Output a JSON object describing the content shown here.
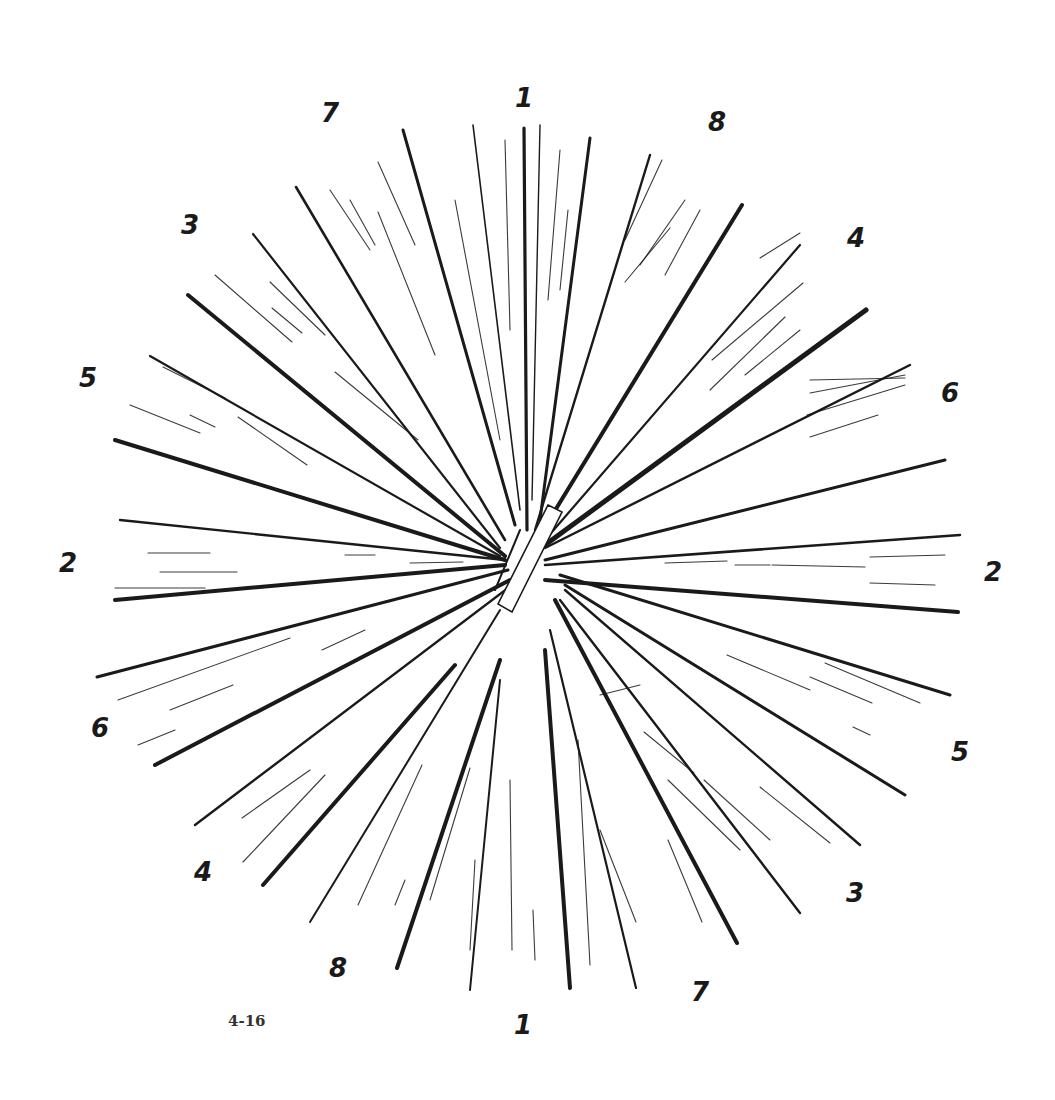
{
  "figure": {
    "caption": "4-16",
    "center": [
      527,
      565
    ],
    "ink_color": "#1a1a1a",
    "background": "#ffffff"
  },
  "labels": [
    {
      "text": "1",
      "x": 524,
      "y": 98
    },
    {
      "text": "7",
      "x": 330,
      "y": 113
    },
    {
      "text": "8",
      "x": 717,
      "y": 122
    },
    {
      "text": "3",
      "x": 190,
      "y": 225
    },
    {
      "text": "4",
      "x": 856,
      "y": 238
    },
    {
      "text": "5",
      "x": 88,
      "y": 378
    },
    {
      "text": "6",
      "x": 950,
      "y": 393
    },
    {
      "text": "2",
      "x": 68,
      "y": 563
    },
    {
      "text": "2",
      "x": 993,
      "y": 572
    },
    {
      "text": "6",
      "x": 100,
      "y": 728
    },
    {
      "text": "5",
      "x": 960,
      "y": 752
    },
    {
      "text": "4",
      "x": 203,
      "y": 872
    },
    {
      "text": "3",
      "x": 855,
      "y": 893
    },
    {
      "text": "8",
      "x": 338,
      "y": 968
    },
    {
      "text": "7",
      "x": 700,
      "y": 992
    },
    {
      "text": "1",
      "x": 523,
      "y": 1025
    }
  ],
  "rays": [
    {
      "x1": 473,
      "y1": 125,
      "x2": 520,
      "y2": 510,
      "w": 1.6
    },
    {
      "x1": 524,
      "y1": 128,
      "x2": 527,
      "y2": 530,
      "w": 3.2
    },
    {
      "x1": 540,
      "y1": 125,
      "x2": 532,
      "y2": 500,
      "w": 1.4
    },
    {
      "x1": 590,
      "y1": 138,
      "x2": 540,
      "y2": 520,
      "w": 3.0
    },
    {
      "x1": 403,
      "y1": 130,
      "x2": 515,
      "y2": 525,
      "w": 3.0
    },
    {
      "x1": 296,
      "y1": 187,
      "x2": 505,
      "y2": 540,
      "w": 2.6
    },
    {
      "x1": 253,
      "y1": 234,
      "x2": 500,
      "y2": 548,
      "w": 2.2
    },
    {
      "x1": 188,
      "y1": 295,
      "x2": 505,
      "y2": 556,
      "w": 4.0
    },
    {
      "x1": 150,
      "y1": 356,
      "x2": 500,
      "y2": 556,
      "w": 2.2
    },
    {
      "x1": 115,
      "y1": 440,
      "x2": 505,
      "y2": 560,
      "w": 4.0
    },
    {
      "x1": 120,
      "y1": 520,
      "x2": 505,
      "y2": 560,
      "w": 2.4
    },
    {
      "x1": 115,
      "y1": 600,
      "x2": 505,
      "y2": 565,
      "w": 4.0
    },
    {
      "x1": 97,
      "y1": 677,
      "x2": 508,
      "y2": 570,
      "w": 3.0
    },
    {
      "x1": 155,
      "y1": 765,
      "x2": 510,
      "y2": 580,
      "w": 4.0
    },
    {
      "x1": 195,
      "y1": 825,
      "x2": 512,
      "y2": 585,
      "w": 2.4
    },
    {
      "x1": 263,
      "y1": 885,
      "x2": 455,
      "y2": 665,
      "w": 4.0
    },
    {
      "x1": 310,
      "y1": 922,
      "x2": 500,
      "y2": 610,
      "w": 2.0
    },
    {
      "x1": 397,
      "y1": 968,
      "x2": 500,
      "y2": 660,
      "w": 4.0
    },
    {
      "x1": 470,
      "y1": 990,
      "x2": 500,
      "y2": 680,
      "w": 2.0
    },
    {
      "x1": 570,
      "y1": 988,
      "x2": 545,
      "y2": 650,
      "w": 4.0
    },
    {
      "x1": 636,
      "y1": 988,
      "x2": 550,
      "y2": 630,
      "w": 2.2
    },
    {
      "x1": 737,
      "y1": 943,
      "x2": 555,
      "y2": 600,
      "w": 4.0
    },
    {
      "x1": 800,
      "y1": 913,
      "x2": 560,
      "y2": 600,
      "w": 2.4
    },
    {
      "x1": 860,
      "y1": 845,
      "x2": 565,
      "y2": 590,
      "w": 2.4
    },
    {
      "x1": 905,
      "y1": 795,
      "x2": 565,
      "y2": 585,
      "w": 3.0
    },
    {
      "x1": 950,
      "y1": 695,
      "x2": 560,
      "y2": 575,
      "w": 3.0
    },
    {
      "x1": 958,
      "y1": 612,
      "x2": 545,
      "y2": 580,
      "w": 4.0
    },
    {
      "x1": 960,
      "y1": 535,
      "x2": 545,
      "y2": 565,
      "w": 2.6
    },
    {
      "x1": 945,
      "y1": 460,
      "x2": 545,
      "y2": 560,
      "w": 3.0
    },
    {
      "x1": 910,
      "y1": 365,
      "x2": 545,
      "y2": 548,
      "w": 2.4
    },
    {
      "x1": 866,
      "y1": 310,
      "x2": 545,
      "y2": 545,
      "w": 5.0
    },
    {
      "x1": 800,
      "y1": 245,
      "x2": 545,
      "y2": 540,
      "w": 2.2
    },
    {
      "x1": 742,
      "y1": 205,
      "x2": 540,
      "y2": 535,
      "w": 4.0
    },
    {
      "x1": 650,
      "y1": 155,
      "x2": 535,
      "y2": 530,
      "w": 2.4
    },
    {
      "x1": 545,
      "y1": 515,
      "x2": 505,
      "y2": 600,
      "w": 3.0
    },
    {
      "x1": 520,
      "y1": 530,
      "x2": 495,
      "y2": 590,
      "w": 2.0
    }
  ],
  "hatch_strokes": [
    {
      "x1": 455,
      "y1": 200,
      "x2": 500,
      "y2": 440
    },
    {
      "x1": 505,
      "y1": 140,
      "x2": 510,
      "y2": 330
    },
    {
      "x1": 560,
      "y1": 150,
      "x2": 548,
      "y2": 300
    },
    {
      "x1": 330,
      "y1": 190,
      "x2": 370,
      "y2": 250
    },
    {
      "x1": 350,
      "y1": 200,
      "x2": 375,
      "y2": 245
    },
    {
      "x1": 378,
      "y1": 162,
      "x2": 415,
      "y2": 245
    },
    {
      "x1": 378,
      "y1": 212,
      "x2": 435,
      "y2": 355
    },
    {
      "x1": 215,
      "y1": 275,
      "x2": 292,
      "y2": 342
    },
    {
      "x1": 270,
      "y1": 282,
      "x2": 325,
      "y2": 335
    },
    {
      "x1": 272,
      "y1": 308,
      "x2": 302,
      "y2": 333
    },
    {
      "x1": 335,
      "y1": 372,
      "x2": 418,
      "y2": 440
    },
    {
      "x1": 163,
      "y1": 367,
      "x2": 225,
      "y2": 398
    },
    {
      "x1": 130,
      "y1": 405,
      "x2": 200,
      "y2": 433
    },
    {
      "x1": 238,
      "y1": 417,
      "x2": 307,
      "y2": 465
    },
    {
      "x1": 190,
      "y1": 415,
      "x2": 215,
      "y2": 427
    },
    {
      "x1": 148,
      "y1": 553,
      "x2": 210,
      "y2": 553
    },
    {
      "x1": 160,
      "y1": 572,
      "x2": 237,
      "y2": 572
    },
    {
      "x1": 115,
      "y1": 588,
      "x2": 205,
      "y2": 588
    },
    {
      "x1": 345,
      "y1": 555,
      "x2": 375,
      "y2": 555
    },
    {
      "x1": 410,
      "y1": 563,
      "x2": 463,
      "y2": 562
    },
    {
      "x1": 118,
      "y1": 700,
      "x2": 290,
      "y2": 638
    },
    {
      "x1": 170,
      "y1": 710,
      "x2": 233,
      "y2": 685
    },
    {
      "x1": 138,
      "y1": 745,
      "x2": 175,
      "y2": 730
    },
    {
      "x1": 322,
      "y1": 650,
      "x2": 365,
      "y2": 630
    },
    {
      "x1": 242,
      "y1": 818,
      "x2": 310,
      "y2": 770
    },
    {
      "x1": 243,
      "y1": 862,
      "x2": 325,
      "y2": 775
    },
    {
      "x1": 358,
      "y1": 905,
      "x2": 422,
      "y2": 765
    },
    {
      "x1": 395,
      "y1": 905,
      "x2": 405,
      "y2": 880
    },
    {
      "x1": 430,
      "y1": 900,
      "x2": 470,
      "y2": 768
    },
    {
      "x1": 470,
      "y1": 950,
      "x2": 475,
      "y2": 860
    },
    {
      "x1": 512,
      "y1": 950,
      "x2": 510,
      "y2": 780
    },
    {
      "x1": 535,
      "y1": 960,
      "x2": 533,
      "y2": 910
    },
    {
      "x1": 590,
      "y1": 965,
      "x2": 578,
      "y2": 740
    },
    {
      "x1": 636,
      "y1": 922,
      "x2": 600,
      "y2": 830
    },
    {
      "x1": 702,
      "y1": 922,
      "x2": 668,
      "y2": 840
    },
    {
      "x1": 600,
      "y1": 695,
      "x2": 640,
      "y2": 685
    },
    {
      "x1": 644,
      "y1": 732,
      "x2": 694,
      "y2": 773
    },
    {
      "x1": 668,
      "y1": 780,
      "x2": 740,
      "y2": 850
    },
    {
      "x1": 704,
      "y1": 780,
      "x2": 770,
      "y2": 840
    },
    {
      "x1": 760,
      "y1": 787,
      "x2": 830,
      "y2": 843
    },
    {
      "x1": 727,
      "y1": 655,
      "x2": 810,
      "y2": 690
    },
    {
      "x1": 810,
      "y1": 677,
      "x2": 872,
      "y2": 703
    },
    {
      "x1": 825,
      "y1": 663,
      "x2": 920,
      "y2": 703
    },
    {
      "x1": 853,
      "y1": 727,
      "x2": 870,
      "y2": 735
    },
    {
      "x1": 665,
      "y1": 563,
      "x2": 727,
      "y2": 561
    },
    {
      "x1": 735,
      "y1": 565,
      "x2": 770,
      "y2": 565
    },
    {
      "x1": 772,
      "y1": 565,
      "x2": 865,
      "y2": 567
    },
    {
      "x1": 870,
      "y1": 557,
      "x2": 945,
      "y2": 555
    },
    {
      "x1": 870,
      "y1": 583,
      "x2": 935,
      "y2": 585
    },
    {
      "x1": 810,
      "y1": 380,
      "x2": 905,
      "y2": 378
    },
    {
      "x1": 810,
      "y1": 393,
      "x2": 905,
      "y2": 375
    },
    {
      "x1": 807,
      "y1": 415,
      "x2": 905,
      "y2": 385
    },
    {
      "x1": 810,
      "y1": 437,
      "x2": 878,
      "y2": 415
    },
    {
      "x1": 745,
      "y1": 375,
      "x2": 800,
      "y2": 330
    },
    {
      "x1": 710,
      "y1": 390,
      "x2": 785,
      "y2": 317
    },
    {
      "x1": 712,
      "y1": 360,
      "x2": 803,
      "y2": 283
    },
    {
      "x1": 760,
      "y1": 258,
      "x2": 800,
      "y2": 233
    },
    {
      "x1": 640,
      "y1": 265,
      "x2": 685,
      "y2": 200
    },
    {
      "x1": 665,
      "y1": 275,
      "x2": 700,
      "y2": 210
    },
    {
      "x1": 625,
      "y1": 282,
      "x2": 670,
      "y2": 228
    },
    {
      "x1": 625,
      "y1": 240,
      "x2": 662,
      "y2": 160
    },
    {
      "x1": 568,
      "y1": 210,
      "x2": 560,
      "y2": 290
    }
  ]
}
